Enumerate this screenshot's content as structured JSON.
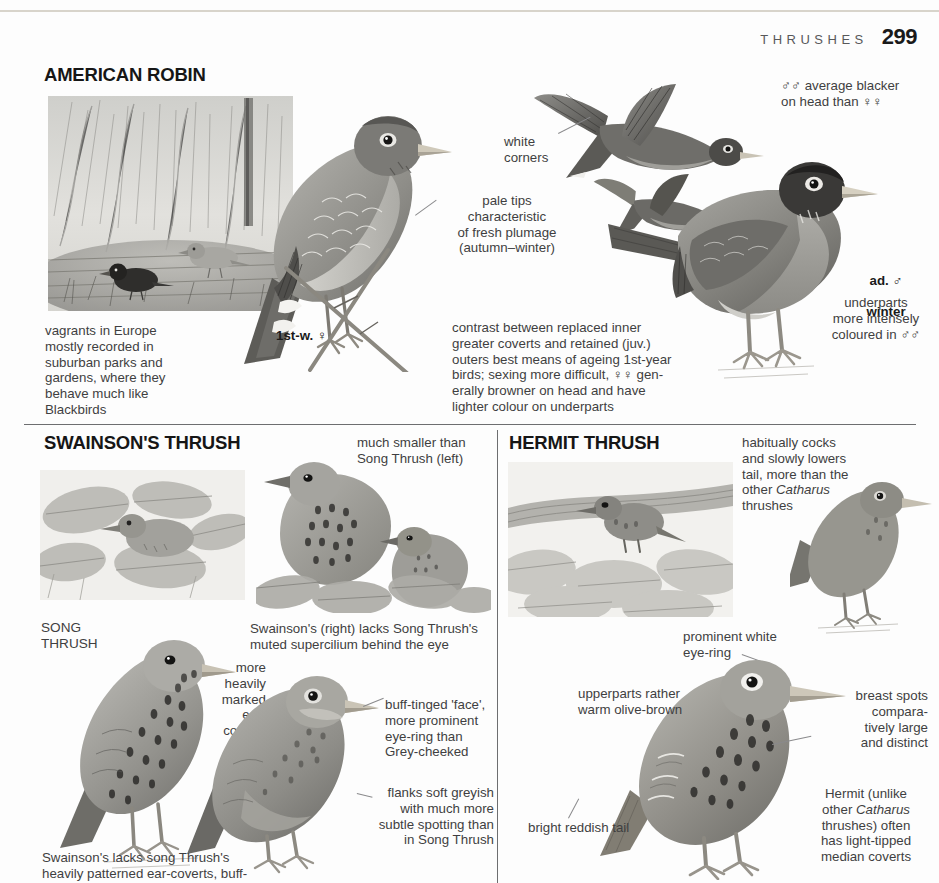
{
  "header": {
    "book_section": "THRUSHES",
    "page_number": "299"
  },
  "sections": {
    "american_robin": {
      "title": "AMERICAN ROBIN",
      "captions": {
        "habitat": "vagrants in Europe\nmostly recorded in\nsuburban parks and\ngardens, where they\nbehave much like\nBlackbirds",
        "white_corners": "white\ncorners",
        "pale_tips": "pale tips\ncharacteristic\nof fresh plumage\n(autumn–winter)",
        "male_head": "♂♂ average blacker\non head than ♀♀",
        "coverts": "contrast between replaced inner\ngreater coverts and retained (juv.)\nouters best means of ageing 1st-year\nbirds; sexing more difficult, ♀♀ gen-\nerally browner on head and have\nlighter colour on underparts",
        "underparts": "underparts\nmore intensely\ncoloured in ♂♂"
      },
      "labels": {
        "first_winter_female": "1st-w. ♀",
        "adult_male_winter_line1": "ad. ♂",
        "adult_male_winter_line2": "winter"
      }
    },
    "swainsons_thrush": {
      "title": "SWAINSON'S THRUSH",
      "labels": {
        "song_thrush": "SONG\nTHRUSH"
      },
      "captions": {
        "size": "much smaller than\nSong Thrush (left)",
        "supercilium": "Swainson's (right) lacks Song Thrush's\nmuted supercilium behind the eye",
        "ear_coverts": "more\nheavily\nmarked\near-\ncoverts",
        "face": "buff-tinged 'face',\nmore prominent\neye-ring than\nGrey-cheeked",
        "flanks": "flanks soft greyish\nwith much more\nsubtle spotting than\nin Song Thrush",
        "bottom": "Swainson's lacks song Thrush's\nheavily patterned ear-coverts, buff-"
      }
    },
    "hermit_thrush": {
      "title": "HERMIT THRUSH",
      "captions": {
        "tail_habit_part1": "habitually cocks\nand slowly lowers\ntail, more than the\nother ",
        "tail_habit_italic": "Catharus",
        "tail_habit_part2": "\nthrushes",
        "eye_ring": "prominent white\neye-ring",
        "upperparts": "upperparts rather\nwarm olive-brown",
        "breast_spots": "breast spots\ncompara-\ntively large\nand distinct",
        "tail_colour": "bright reddish tail",
        "median_coverts_part1": "Hermit (unlike\nother ",
        "median_coverts_italic": "Catharus",
        "median_coverts_part2": "\nthrushes) often\nhas light-tipped\nmedian coverts"
      }
    }
  },
  "colors": {
    "ink": "#231f20",
    "caption_grey": "#3f3f41",
    "rule_grey": "#6d6e70",
    "header_grey": "#58585a",
    "plate_grey": "#9a9a97"
  }
}
